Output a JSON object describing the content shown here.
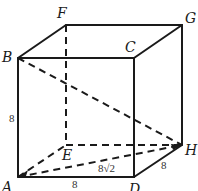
{
  "figure": {
    "type": "cube",
    "vertices": {
      "A": {
        "label": "A",
        "x": 18,
        "y": 177
      },
      "B": {
        "label": "B",
        "x": 18,
        "y": 58
      },
      "C": {
        "label": "C",
        "x": 134,
        "y": 58
      },
      "D": {
        "label": "D",
        "x": 134,
        "y": 177
      },
      "E": {
        "label": "E",
        "x": 66,
        "y": 145
      },
      "F": {
        "label": "F",
        "x": 66,
        "y": 25
      },
      "G": {
        "label": "G",
        "x": 182,
        "y": 25
      },
      "H": {
        "label": "H",
        "x": 182,
        "y": 145
      }
    },
    "solid_edges": [
      "AB",
      "BC",
      "CD",
      "DA",
      "BF",
      "FG",
      "CG",
      "GH",
      "DH"
    ],
    "dashed_edges": [
      "FE",
      "EH",
      "AE",
      "BH",
      "AH"
    ],
    "measurements": {
      "AB": "8",
      "AD": "8",
      "DH": "8",
      "AH": "8√2"
    },
    "colors": {
      "stroke": "#1a1a1a",
      "background": "#ffffff"
    }
  }
}
